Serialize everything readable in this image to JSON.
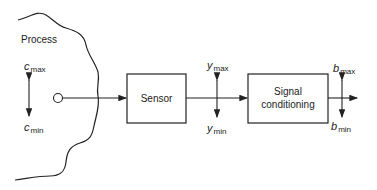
{
  "diagram": {
    "process_label": "Process",
    "input_variable": {
      "symbol": "c",
      "max_sub": "max",
      "min_sub": "min"
    },
    "blocks": [
      {
        "id": "sensor",
        "label": "Sensor"
      },
      {
        "id": "signal-conditioning",
        "label_line1": "Signal",
        "label_line2": "conditioning"
      }
    ],
    "sensor_output": {
      "symbol": "y",
      "max_sub": "max",
      "min_sub": "min"
    },
    "conditioner_output": {
      "symbol": "b",
      "max_sub": "max",
      "min_sub": "min"
    },
    "colors": {
      "line": "#222222",
      "background": "#ffffff"
    }
  }
}
